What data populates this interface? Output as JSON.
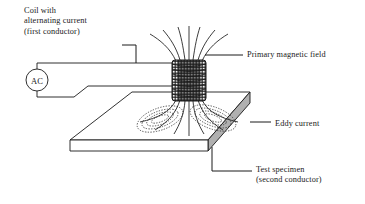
{
  "figure": {
    "name": "eddy-current-testing-diagram",
    "background": "#ffffff",
    "line_color": "#1a1a1a",
    "slab_side_fill": "#b0b0b0",
    "slab_top_fill": "#ffffff"
  },
  "labels": {
    "coil": "Coil with\nalternating current\n(first conductor)",
    "primary_field": "Primary magnetic field",
    "eddy_current": "Eddy current",
    "test_specimen": "Test specimen\n(second conductor)"
  },
  "source": {
    "symbol": "AC"
  },
  "parts": {
    "coil_icon": "coil-winding",
    "field_icon": "magnetic-field-lines",
    "eddy_icon": "eddy-current-loops",
    "slab_icon": "test-specimen-slab",
    "ac_icon": "ac-source-circle"
  }
}
